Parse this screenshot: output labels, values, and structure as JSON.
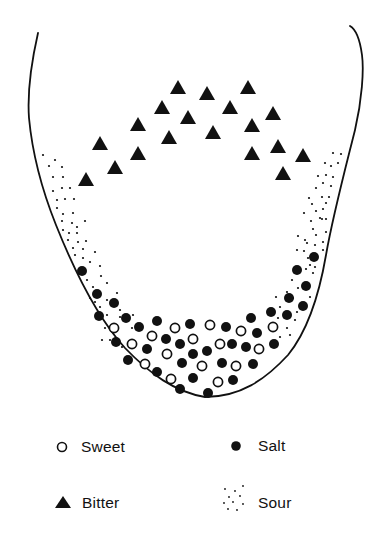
{
  "figure": {
    "colors": {
      "ink": "#111111",
      "background": "#ffffff"
    },
    "outline": {
      "path": "M38,33 C33,55 27,90 29,118 C32,150 42,190 56,225 C72,265 95,315 125,348 C150,374 175,392 205,397 C240,397 265,380 288,355 C310,328 320,290 326,255 C333,215 345,170 355,130 C362,100 364,70 362,55 C360,40 357,30 350,26"
    },
    "regions": {
      "bitter": {
        "symbol": "filled-triangle",
        "points": [
          [
            178,
            87
          ],
          [
            207,
            93
          ],
          [
            248,
            87
          ],
          [
            162,
            107
          ],
          [
            188,
            117
          ],
          [
            230,
            107
          ],
          [
            273,
            113
          ],
          [
            138,
            124
          ],
          [
            169,
            137
          ],
          [
            213,
            132
          ],
          [
            252,
            125
          ],
          [
            100,
            143
          ],
          [
            138,
            153
          ],
          [
            252,
            153
          ],
          [
            278,
            146
          ],
          [
            303,
            155
          ],
          [
            115,
            167
          ],
          [
            86,
            179
          ],
          [
            283,
            173
          ]
        ]
      },
      "salt": {
        "symbol": "filled-circle",
        "points": [
          [
            82,
            271
          ],
          [
            97,
            294
          ],
          [
            114,
            303
          ],
          [
            99,
            316
          ],
          [
            126,
            318
          ],
          [
            139,
            327
          ],
          [
            157,
            321
          ],
          [
            116,
            342
          ],
          [
            128,
            360
          ],
          [
            147,
            349
          ],
          [
            166,
            339
          ],
          [
            180,
            344
          ],
          [
            190,
            324
          ],
          [
            193,
            354
          ],
          [
            182,
            363
          ],
          [
            207,
            351
          ],
          [
            157,
            372
          ],
          [
            193,
            378
          ],
          [
            180,
            389
          ],
          [
            208,
            393
          ],
          [
            226,
            327
          ],
          [
            232,
            344
          ],
          [
            222,
            363
          ],
          [
            233,
            380
          ],
          [
            246,
            347
          ],
          [
            257,
            333
          ],
          [
            251,
            318
          ],
          [
            253,
            364
          ],
          [
            274,
            344
          ],
          [
            271,
            312
          ],
          [
            287,
            315
          ],
          [
            289,
            298
          ],
          [
            303,
            306
          ],
          [
            297,
            270
          ],
          [
            306,
            286
          ],
          [
            314,
            257
          ]
        ]
      },
      "sweet": {
        "symbol": "open-circle",
        "points": [
          [
            114,
            328
          ],
          [
            132,
            344
          ],
          [
            152,
            336
          ],
          [
            175,
            328
          ],
          [
            167,
            354
          ],
          [
            193,
            339
          ],
          [
            210,
            325
          ],
          [
            220,
            344
          ],
          [
            202,
            366
          ],
          [
            145,
            364
          ],
          [
            171,
            379
          ],
          [
            218,
            382
          ],
          [
            236,
            366
          ],
          [
            241,
            331
          ],
          [
            259,
            349
          ],
          [
            273,
            327
          ]
        ]
      },
      "sour": {
        "symbol": "stipple-dots",
        "points": [
          [
            43,
            155
          ],
          [
            49,
            166
          ],
          [
            55,
            160
          ],
          [
            62,
            167
          ],
          [
            53,
            177
          ],
          [
            63,
            177
          ],
          [
            53,
            191
          ],
          [
            62,
            188
          ],
          [
            70,
            188
          ],
          [
            57,
            200
          ],
          [
            65,
            199
          ],
          [
            74,
            199
          ],
          [
            57,
            208
          ],
          [
            63,
            214
          ],
          [
            73,
            213
          ],
          [
            62,
            221
          ],
          [
            72,
            223
          ],
          [
            85,
            221
          ],
          [
            63,
            230
          ],
          [
            69,
            233
          ],
          [
            77,
            227
          ],
          [
            77,
            233
          ],
          [
            68,
            240
          ],
          [
            78,
            242
          ],
          [
            86,
            241
          ],
          [
            73,
            248
          ],
          [
            83,
            249
          ],
          [
            95,
            252
          ],
          [
            75,
            255
          ],
          [
            83,
            258
          ],
          [
            90,
            262
          ],
          [
            100,
            266
          ],
          [
            87,
            280
          ],
          [
            101,
            276
          ],
          [
            93,
            287
          ],
          [
            107,
            283
          ],
          [
            117,
            293
          ],
          [
            90,
            298
          ],
          [
            107,
            300
          ],
          [
            100,
            307
          ],
          [
            120,
            310
          ],
          [
            95,
            302
          ],
          [
            107,
            315
          ],
          [
            120,
            317
          ],
          [
            133,
            315
          ],
          [
            105,
            328
          ],
          [
            102,
            340
          ],
          [
            110,
            340
          ],
          [
            122,
            347
          ],
          [
            132,
            328
          ],
          [
            333,
            153
          ],
          [
            341,
            154
          ],
          [
            325,
            163
          ],
          [
            331,
            166
          ],
          [
            338,
            163
          ],
          [
            318,
            176
          ],
          [
            326,
            175
          ],
          [
            333,
            177
          ],
          [
            323,
            183
          ],
          [
            331,
            186
          ],
          [
            316,
            188
          ],
          [
            309,
            198
          ],
          [
            322,
            197
          ],
          [
            329,
            197
          ],
          [
            312,
            204
          ],
          [
            326,
            203
          ],
          [
            316,
            211
          ],
          [
            323,
            209
          ],
          [
            304,
            213
          ],
          [
            311,
            221
          ],
          [
            322,
            219
          ],
          [
            326,
            219
          ],
          [
            313,
            229
          ],
          [
            326,
            232
          ],
          [
            298,
            236
          ],
          [
            316,
            235
          ],
          [
            305,
            240
          ],
          [
            323,
            242
          ],
          [
            315,
            245
          ],
          [
            297,
            250
          ],
          [
            304,
            251
          ],
          [
            308,
            258
          ],
          [
            306,
            269
          ],
          [
            315,
            267
          ],
          [
            313,
            273
          ],
          [
            320,
            218
          ],
          [
            307,
            243
          ],
          [
            323,
            250
          ],
          [
            310,
            265
          ],
          [
            292,
            280
          ],
          [
            298,
            288
          ],
          [
            287,
            292
          ],
          [
            276,
            297
          ],
          [
            293,
            298
          ],
          [
            310,
            297
          ],
          [
            280,
            307
          ],
          [
            297,
            312
          ],
          [
            278,
            318
          ],
          [
            295,
            320
          ],
          [
            287,
            328
          ],
          [
            280,
            337
          ],
          [
            290,
            335
          ]
        ]
      }
    }
  },
  "legend": {
    "items": [
      {
        "key": "sweet",
        "label": "Sweet",
        "symbol": "open-circle"
      },
      {
        "key": "salt",
        "label": "Salt",
        "symbol": "filled-circle"
      },
      {
        "key": "bitter",
        "label": "Bitter",
        "symbol": "filled-triangle"
      },
      {
        "key": "sour",
        "label": "Sour",
        "symbol": "stipple-dots"
      }
    ]
  }
}
